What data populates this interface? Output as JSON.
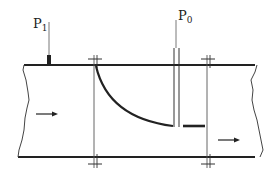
{
  "diagram": {
    "labels": {
      "p1_main": "P",
      "p1_sub": "1",
      "p0_main": "P",
      "p0_sub": "0"
    },
    "elements": [
      "pipe",
      "upstream-wall-tap",
      "pitot-probe",
      "flanges",
      "flow-arrows",
      "bent-vane"
    ],
    "colors": {
      "ink": "#222222",
      "background": "#ffffff"
    }
  }
}
